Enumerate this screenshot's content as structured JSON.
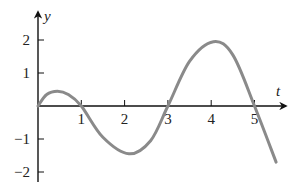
{
  "chart_data": {
    "type": "line",
    "title": "",
    "xlabel": "t",
    "ylabel": "y",
    "xlim": [
      0,
      5.6
    ],
    "ylim": [
      -2.1,
      2.7
    ],
    "grid": false,
    "legend": null,
    "x_ticks": [
      1,
      2,
      3,
      4,
      5
    ],
    "x_tick_labels": [
      "1",
      "2",
      "3",
      "4",
      "5"
    ],
    "y_ticks": [
      2,
      1,
      -1,
      -2
    ],
    "y_tick_labels": [
      "2",
      "1",
      "−1",
      "−2"
    ],
    "series": [
      {
        "name": "y(t)",
        "color": "#8a8a8a",
        "x": [
          0,
          0.2,
          0.45,
          0.7,
          1,
          1.5,
          2.1,
          2.6,
          3,
          3.5,
          4.05,
          4.5,
          5,
          5.5
        ],
        "y": [
          0,
          0.35,
          0.45,
          0.35,
          0,
          -0.95,
          -1.45,
          -1.05,
          0,
          1.35,
          1.95,
          1.55,
          0,
          -1.7
        ]
      }
    ],
    "annotations": {
      "zero_crossings_t": [
        0,
        1,
        3,
        5
      ],
      "local_max": [
        [
          0.45,
          0.45
        ],
        [
          4.05,
          1.95
        ]
      ],
      "local_min": [
        [
          2.1,
          -1.45
        ]
      ]
    },
    "axis_color": "#111111"
  }
}
